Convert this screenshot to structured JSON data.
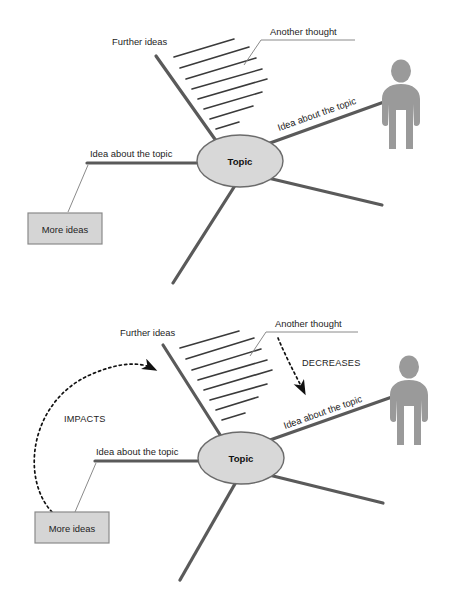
{
  "meta": {
    "background": "#ffffff"
  },
  "colors": {
    "branch": "#5a5a5a",
    "branch_dark": "#4a4a4a",
    "node_fill": "#d8d8d8",
    "node_stroke": "#6b6b6b",
    "box_fill": "#d5d5d5",
    "box_stroke": "#8a8a8a",
    "person": "#9a9a9a",
    "hatch": "#3a3a3a",
    "leader": "#8a8a8a",
    "relation_arrow": "#111111",
    "text": "#1d1d1d"
  },
  "diagrams": [
    {
      "id": "diagram-top",
      "name": "plain-mind-map",
      "center_node": {
        "label": "Topic"
      },
      "labels": {
        "further_ideas": "Further ideas",
        "another_thought": "Another thought",
        "idea_right": "Idea about the topic",
        "idea_left": "Idea about the topic",
        "more_ideas_box": "More ideas"
      },
      "hatch_line_count": 8,
      "person_icon": "person-icon",
      "relations": []
    },
    {
      "id": "diagram-bottom",
      "name": "annotated-mind-map",
      "center_node": {
        "label": "Topic"
      },
      "labels": {
        "further_ideas": "Further ideas",
        "another_thought": "Another thought",
        "idea_right": "Idea about the topic",
        "idea_left": "Idea about the topic",
        "more_ideas_box": "More ideas"
      },
      "hatch_line_count": 8,
      "person_icon": "person-icon",
      "relations": [
        {
          "label": "IMPACTS",
          "from": "More ideas",
          "to": "Further ideas branch",
          "style": "dotted-curved-arrow"
        },
        {
          "label": "DECREASES",
          "from": "Another thought",
          "to": "Idea about the topic branch",
          "style": "dotted-straight-arrow"
        }
      ]
    }
  ]
}
